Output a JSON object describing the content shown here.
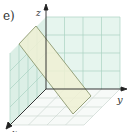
{
  "figure": {
    "panel_label": "e)",
    "axes": {
      "x": "x",
      "y": "y",
      "z": "z"
    },
    "colors": {
      "wall": "#e3f3ec",
      "grid": "#9cc9b6",
      "floor_grid": "#c9d6d0",
      "plane_fill": "#eef0d6",
      "plane_edge": "#8f9a6e",
      "axis": "#222222"
    }
  }
}
